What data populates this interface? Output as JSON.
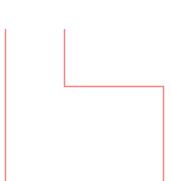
{
  "canvas": {
    "width": 172,
    "height": 181,
    "background_color": "#ffffff",
    "description": "blank white canvas with a thin salmon step-shaped outline overlay"
  },
  "overlay": {
    "name": "step-outline-annotation",
    "stroke_color": "#f28585",
    "stroke_width": 1.5,
    "opacity": 1,
    "segments": [
      {
        "name": "left-vertical-rule",
        "orientation": "vertical",
        "x": 5.5,
        "y_start": 29,
        "y_end": 181,
        "length": 152
      },
      {
        "name": "inner-vertical-rule",
        "orientation": "vertical",
        "x": 64.5,
        "y_start": 29,
        "y_end": 86,
        "length": 57
      },
      {
        "name": "horizontal-rule",
        "orientation": "horizontal",
        "y": 86.5,
        "x_start": 64,
        "x_end": 164,
        "length": 100
      },
      {
        "name": "right-vertical-rule",
        "orientation": "vertical",
        "x": 163.5,
        "y_start": 86,
        "y_end": 181,
        "length": 95
      }
    ],
    "corners": [
      {
        "name": "inner-corner",
        "x": 64.5,
        "y": 86.5,
        "type": "bottom-left-elbow"
      },
      {
        "name": "outer-corner",
        "x": 163.5,
        "y": 86.5,
        "type": "top-right-elbow"
      }
    ],
    "polyline_points": "64.5,29 64.5,86.5 163.5,86.5 163.5,181"
  }
}
